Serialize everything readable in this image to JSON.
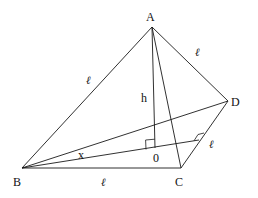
{
  "diagram": {
    "type": "tetrahedron-geometry",
    "vertices": {
      "A": {
        "label": "A",
        "x": 152,
        "y": 27,
        "lx": 146,
        "ly": 21
      },
      "B": {
        "label": "B",
        "x": 22,
        "y": 168,
        "lx": 13,
        "ly": 186
      },
      "C": {
        "label": "C",
        "x": 181,
        "y": 168,
        "lx": 175,
        "ly": 186
      },
      "D": {
        "label": "D",
        "x": 228,
        "y": 101,
        "lx": 231,
        "ly": 106
      },
      "O": {
        "label": "0",
        "x": 155,
        "y": 148,
        "lx": 153,
        "ly": 162
      }
    },
    "edges": [
      {
        "from": "A",
        "to": "B"
      },
      {
        "from": "A",
        "to": "C"
      },
      {
        "from": "A",
        "to": "D"
      },
      {
        "from": "B",
        "to": "C"
      },
      {
        "from": "C",
        "to": "D"
      },
      {
        "from": "B",
        "to": "D"
      },
      {
        "from": "A",
        "to": "O"
      },
      {
        "from": "B",
        "to": "E"
      }
    ],
    "foot_on_CD": {
      "x": 199,
      "y": 140
    },
    "labels": {
      "AB_length": {
        "text": "ℓ",
        "x": 86,
        "y": 84
      },
      "AD_length": {
        "text": "ℓ",
        "x": 195,
        "y": 56
      },
      "BC_length": {
        "text": "ℓ",
        "x": 101,
        "y": 186
      },
      "CD_length": {
        "text": "ℓ",
        "x": 209,
        "y": 148
      },
      "height": {
        "text": "h",
        "x": 141,
        "y": 102
      },
      "angle": {
        "text": "x",
        "x": 78,
        "y": 159
      }
    }
  }
}
